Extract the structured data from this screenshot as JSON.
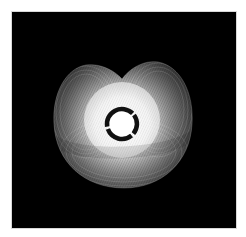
{
  "artwork": {
    "description": "Abstract generative line art: glowing white mesh shell with two upper lobes around a dark segmented ring",
    "colors": {
      "page_background": "#ffffff",
      "canvas_background": "#000000",
      "mesh": "#ffffff",
      "glow_center": "#ffffff",
      "ring": "#111111"
    },
    "ring": {
      "segments": 3
    }
  }
}
